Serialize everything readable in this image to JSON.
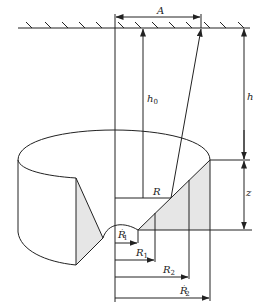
{
  "diagram": {
    "type": "engineering schematic: subsidence / excavation geometry",
    "labels": {
      "A": "A",
      "h0": "h",
      "h0_sub": "0",
      "h": "h",
      "z": "z",
      "R": "R",
      "R1p": "R",
      "R1p_sub": "1",
      "R1p_sup": "′",
      "R1": "R",
      "R1_sub": "1",
      "R2": "R",
      "R2_sub": "2",
      "R2p": "R",
      "R2p_sub": "2",
      "R2p_sup": "′"
    },
    "colors": {
      "line": "#222222",
      "shade": "#e6e6e6",
      "background": "#ffffff"
    }
  }
}
